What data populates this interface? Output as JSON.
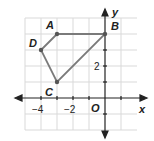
{
  "diagram": {
    "type": "coordinate-plane-polygon",
    "axes": {
      "x_label": "x",
      "y_label": "y",
      "origin_label": "O",
      "x_tick_labels": [
        "−4",
        "−2"
      ],
      "y_tick_labels": [
        "2"
      ]
    },
    "points": [
      {
        "name": "A",
        "x": -3,
        "y": 4
      },
      {
        "name": "B",
        "x": 0,
        "y": 4
      },
      {
        "name": "C",
        "x": -3,
        "y": 1
      },
      {
        "name": "D",
        "x": -4,
        "y": 3
      }
    ],
    "polygon_order": [
      "A",
      "B",
      "C",
      "D"
    ],
    "colors": {
      "polygon": "#7a7a7a",
      "grid": "#d9d9d9",
      "axis": "#222222"
    }
  }
}
